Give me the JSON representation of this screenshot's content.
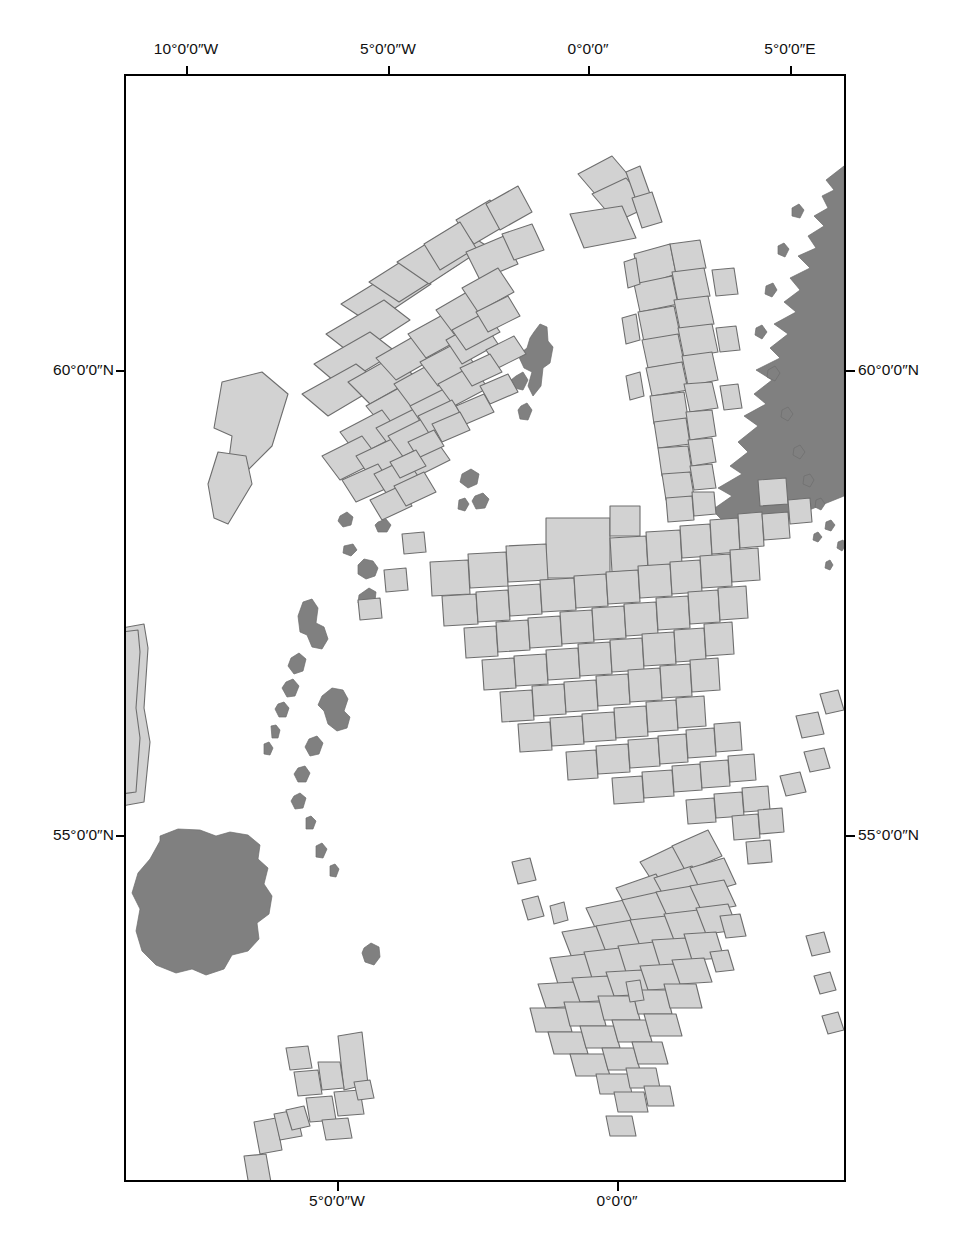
{
  "figure": {
    "kind": "map",
    "title": "",
    "projection_note": "conic projection (meridian ticks differ top vs bottom)",
    "background_color": "#ffffff",
    "frame": {
      "color": "#000000",
      "x": 124,
      "y": 74,
      "width": 722,
      "height": 1108,
      "border_width_px": 2.5
    }
  },
  "graticule": {
    "top_labels": [
      {
        "text": "10°0′0″W",
        "x": 186
      },
      {
        "text": "5°0′0″W",
        "x": 388
      },
      {
        "text": "0°0′0″",
        "x": 588
      },
      {
        "text": "5°0′0″E",
        "x": 790
      }
    ],
    "bottom_labels": [
      {
        "text": "5°0′0″W",
        "x": 337
      },
      {
        "text": "0°0′0″",
        "x": 617
      }
    ],
    "left_labels": [
      {
        "text": "60°0′0″N",
        "y": 370
      },
      {
        "text": "55°0′0″N",
        "y": 835
      }
    ],
    "right_labels": [
      {
        "text": "60°0′0″N",
        "y": 370
      },
      {
        "text": "55°0′0″N",
        "y": 835
      }
    ]
  },
  "legend_colors": {
    "land_fill": "#808080",
    "land_stroke": "#6d6d6d",
    "licence_block_fill": "#d2d2d2",
    "licence_block_stroke": "#6e6e6e",
    "sea_fill": "#ffffff",
    "frame_stroke": "#000000",
    "text": "#111111"
  },
  "map_features": {
    "landmasses": [
      "Great Britain (Scotland, England, Wales)",
      "Ireland",
      "Outer Hebrides",
      "Orkney Islands",
      "Shetland Islands",
      "Isle of Man",
      "Norway west coast (clipped at east frame edge)"
    ],
    "licence_block_clusters": [
      "West of Shetland / Faroe–Shetland Basin",
      "Rockall Trough (clipped at west frame edge)",
      "North of Shetland",
      "Northern North Sea / East Shetland Basin",
      "Central North Sea / Moray Firth",
      "Southern North Sea",
      "Irish Sea / Morecambe Bay",
      "St George’s Channel / Cardigan Bay"
    ]
  }
}
